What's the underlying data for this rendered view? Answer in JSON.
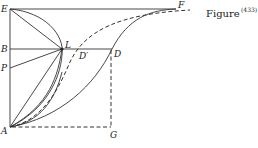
{
  "figure": {
    "caption": "Figure",
    "caption_superscript": "(433)",
    "points": {
      "E": "E",
      "F": "F",
      "B": "B",
      "P": "P",
      "L": "L",
      "D": "D",
      "D_prime": "D′",
      "A": "A",
      "G": "G"
    }
  }
}
